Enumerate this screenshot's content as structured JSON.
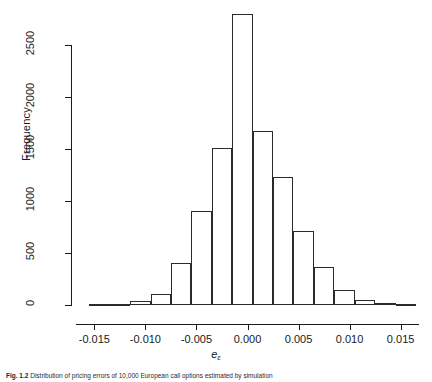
{
  "figure": {
    "caption_number": "Fig. 1.2",
    "caption_text": "Distribution of pricing errors of 10,000 European call options estimated by simulation"
  },
  "chart_data": {
    "type": "bar",
    "title": "",
    "xlabel": "e",
    "xlabel_subscript": "ε",
    "ylabel": "Frequency",
    "xlim": [
      -0.0168,
      0.0168
    ],
    "ylim": [
      0,
      2900
    ],
    "grid": false,
    "legend": "none",
    "bin_width": 0.002,
    "x_ticks": [
      -0.015,
      -0.01,
      -0.005,
      0,
      0.005,
      0.01,
      0.015
    ],
    "x_tick_labels": [
      "-0.015",
      "-0.010",
      "-0.005",
      "0.000",
      "0.005",
      "0.010",
      "0.015"
    ],
    "y_ticks": [
      0,
      500,
      1000,
      1500,
      2000,
      2500
    ],
    "y_tick_labels": [
      "0",
      "500",
      "1000",
      "1500",
      "2000",
      "2500"
    ],
    "bins": [
      {
        "left": -0.0155,
        "right": -0.0135,
        "value": 5
      },
      {
        "left": -0.0135,
        "right": -0.0115,
        "value": 10
      },
      {
        "left": -0.0115,
        "right": -0.0095,
        "value": 40
      },
      {
        "left": -0.0095,
        "right": -0.0075,
        "value": 110
      },
      {
        "left": -0.0075,
        "right": -0.0055,
        "value": 400
      },
      {
        "left": -0.0055,
        "right": -0.0035,
        "value": 900
      },
      {
        "left": -0.0035,
        "right": -0.0015,
        "value": 1510
      },
      {
        "left": -0.0015,
        "right": 0.0005,
        "value": 2800
      },
      {
        "left": 0.0005,
        "right": 0.0025,
        "value": 1670
      },
      {
        "left": 0.0025,
        "right": 0.0045,
        "value": 1230
      },
      {
        "left": 0.0045,
        "right": 0.0065,
        "value": 710
      },
      {
        "left": 0.0065,
        "right": 0.0085,
        "value": 370
      },
      {
        "left": 0.0085,
        "right": 0.0105,
        "value": 140
      },
      {
        "left": 0.0105,
        "right": 0.0125,
        "value": 50
      },
      {
        "left": 0.0125,
        "right": 0.0145,
        "value": 15
      },
      {
        "left": 0.0145,
        "right": 0.0165,
        "value": 5
      }
    ]
  }
}
